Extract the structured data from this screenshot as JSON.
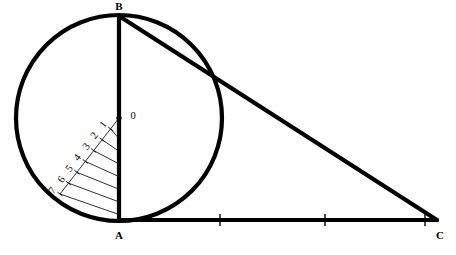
{
  "figure": {
    "background_color": "#ffffff",
    "ink_color": "#000000",
    "hatch_color": "#1a1a1a"
  },
  "vertices": [
    {
      "id": "B",
      "label": "B",
      "x": 119,
      "y": 16,
      "label_x": 119,
      "label_y": 7
    },
    {
      "id": "A",
      "label": "A",
      "x": 119,
      "y": 220,
      "label_x": 119,
      "label_y": 236
    },
    {
      "id": "C",
      "label": "C",
      "x": 437,
      "y": 220,
      "label_x": 440,
      "label_y": 236
    }
  ],
  "circle": {
    "name": "inscribed-circle",
    "center_label": "O",
    "center_x": 119,
    "center_y": 118,
    "radius": 103,
    "center_label_x": 133,
    "center_label_y": 117,
    "center_dot_radius": 2.6,
    "stroke_width": 4.2
  },
  "triangle": {
    "name": "right-triangle-ABC",
    "stroke_width": 4.2,
    "sides": [
      {
        "name": "side-AB",
        "from": "A",
        "to": "B",
        "x1": 119,
        "y1": 220,
        "x2": 119,
        "y2": 16
      },
      {
        "name": "side-AC",
        "from": "A",
        "to": "C",
        "x1": 119,
        "y1": 220,
        "x2": 437,
        "y2": 220
      },
      {
        "name": "side-BC",
        "from": "B",
        "to": "C",
        "x1": 119,
        "y1": 16,
        "x2": 437,
        "y2": 220
      }
    ]
  },
  "baseline_ticks": {
    "name": "segment-AC-tick-marks",
    "count": 3,
    "positions_x": [
      220,
      325,
      425
    ],
    "y": 220,
    "half_height": 6,
    "stroke_width": 1.4
  },
  "division_ray": {
    "name": "division-ray-from-O",
    "from_x": 119,
    "from_y": 118,
    "to_x": 60,
    "to_y": 194,
    "stroke_width": 1.0
  },
  "division_marks": [
    {
      "label": "0",
      "x": 119,
      "y": 118,
      "label_x": 133,
      "label_y": 117,
      "rotation": 0
    },
    {
      "label": "1",
      "x": 110.6,
      "y": 128.9,
      "label_x": 104,
      "label_y": 125,
      "rotation": -52
    },
    {
      "label": "2",
      "x": 102.1,
      "y": 139.7,
      "label_x": 95,
      "label_y": 136,
      "rotation": -52
    },
    {
      "label": "3",
      "x": 93.7,
      "y": 150.6,
      "label_x": 87,
      "label_y": 147,
      "rotation": -52
    },
    {
      "label": "4",
      "x": 85.3,
      "y": 161.4,
      "label_x": 78,
      "label_y": 158,
      "rotation": -52
    },
    {
      "label": "5",
      "x": 76.9,
      "y": 172.3,
      "label_x": 70,
      "label_y": 169,
      "rotation": -52
    },
    {
      "label": "6",
      "x": 68.4,
      "y": 183.1,
      "label_x": 62,
      "label_y": 180,
      "rotation": -52
    },
    {
      "label": "7",
      "x": 60.0,
      "y": 194.0,
      "label_x": 53,
      "label_y": 191,
      "rotation": -52
    }
  ],
  "hatch_lines": {
    "name": "hatched-region-lines",
    "count": 7,
    "stroke_width": 0.9,
    "description": "Parallel lines joining each division point on the ray to the vertical side AB",
    "lines": [
      {
        "x1": 110.6,
        "y1": 128.9,
        "x2": 119,
        "y2": 138.6
      },
      {
        "x1": 102.1,
        "y1": 139.7,
        "x2": 119,
        "y2": 151.3
      },
      {
        "x1": 93.7,
        "y1": 150.6,
        "x2": 119,
        "y2": 163.9
      },
      {
        "x1": 85.3,
        "y1": 161.4,
        "x2": 119,
        "y2": 176.6
      },
      {
        "x1": 76.9,
        "y1": 172.3,
        "x2": 119,
        "y2": 189.2
      },
      {
        "x1": 68.4,
        "y1": 183.1,
        "x2": 119,
        "y2": 201.9
      },
      {
        "x1": 60.0,
        "y1": 194.0,
        "x2": 119,
        "y2": 214.5
      }
    ]
  }
}
